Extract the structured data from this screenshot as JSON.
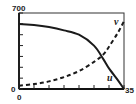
{
  "chart_data": {
    "type": "line",
    "title": "",
    "xlabel": "",
    "ylabel": "",
    "xlim": [
      0,
      35
    ],
    "ylim": [
      0,
      700
    ],
    "x_ticks": [
      0,
      5,
      10,
      15,
      20,
      25,
      30,
      35
    ],
    "y_ticks": [
      0,
      100,
      200,
      300,
      400,
      500,
      600,
      700
    ],
    "x_tick_labels_shown": [
      "0",
      "35"
    ],
    "y_tick_labels_shown": [
      "0",
      "700"
    ],
    "grid": false,
    "legend": "inline labels",
    "series": [
      {
        "name": "u",
        "style": "solid",
        "color": "#1a1a1a",
        "x": [
          0,
          5,
          10,
          15,
          20,
          25,
          28,
          30,
          33,
          35
        ],
        "y": [
          600,
          590,
          570,
          540,
          500,
          400,
          280,
          190,
          80,
          0
        ]
      },
      {
        "name": "v",
        "style": "dashed",
        "color": "#1a1a1a",
        "x": [
          0,
          5,
          10,
          15,
          20,
          25,
          28,
          30,
          33,
          35
        ],
        "y": [
          30,
          45,
          70,
          110,
          165,
          250,
          315,
          390,
          520,
          625
        ]
      }
    ]
  },
  "labels": {
    "y_max": "700",
    "y_min": "0",
    "x_min": "0",
    "x_max": "35",
    "series_u": "u",
    "series_v": "v"
  }
}
